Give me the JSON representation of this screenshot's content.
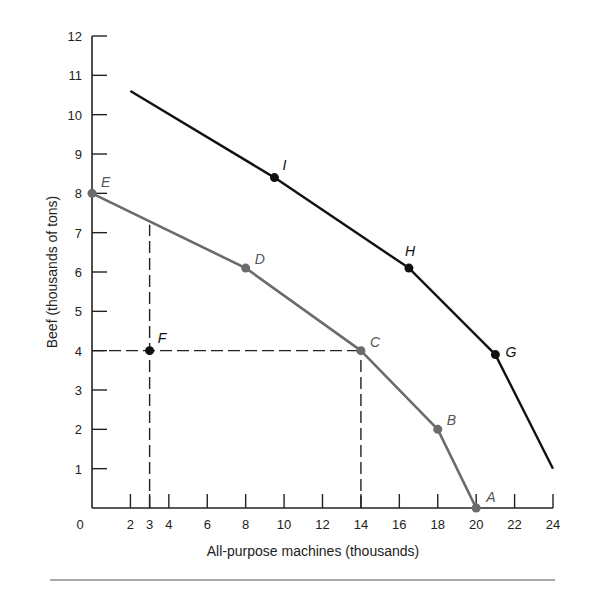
{
  "chart_data": {
    "type": "line",
    "title": "",
    "xlabel": "All-purpose machines (thousands)",
    "ylabel": "Beef (thousands of tons)",
    "xlim": [
      0,
      24
    ],
    "ylim": [
      0,
      12
    ],
    "x_ticks": [
      2,
      3,
      4,
      6,
      8,
      10,
      12,
      14,
      16,
      18,
      20,
      22,
      24
    ],
    "x_tick_labels": [
      "0",
      "2",
      "3",
      "4",
      "6",
      "8",
      "10",
      "12",
      "14",
      "16",
      "18",
      "20",
      "22",
      "24"
    ],
    "y_ticks": [
      1,
      2,
      3,
      4,
      5,
      6,
      7,
      8,
      9,
      10,
      11,
      12
    ],
    "y_tick_labels": [
      "1",
      "2",
      "3",
      "4",
      "5",
      "6",
      "7",
      "8",
      "9",
      "10",
      "11",
      "12"
    ],
    "grid": false,
    "legend": null,
    "series": [
      {
        "name": "Production possibilities curve (original)",
        "color": "#6b6b6b",
        "points": [
          {
            "label": "E",
            "x": 0,
            "y": 8
          },
          {
            "label": "D",
            "x": 8,
            "y": 6.1
          },
          {
            "label": "C",
            "x": 14,
            "y": 4
          },
          {
            "label": "B",
            "x": 18,
            "y": 2
          },
          {
            "label": "A",
            "x": 20,
            "y": 0
          }
        ]
      },
      {
        "name": "Production possibilities curve (shifted outward)",
        "color": "#111111",
        "start": {
          "x": 2,
          "y": 10.6
        },
        "end": {
          "x": 24,
          "y": 1.0
        },
        "points": [
          {
            "label": "I",
            "x": 9.5,
            "y": 8.4
          },
          {
            "label": "H",
            "x": 16.5,
            "y": 6.1
          },
          {
            "label": "G",
            "x": 21,
            "y": 3.9
          }
        ]
      },
      {
        "name": "Point F (inefficient)",
        "color": "#111111",
        "points": [
          {
            "label": "F",
            "x": 3,
            "y": 4
          }
        ]
      }
    ],
    "reference_lines": [
      {
        "type": "vertical-dashed",
        "x": 3,
        "y_from": 0,
        "y_to": 7.2
      },
      {
        "type": "vertical-dashed",
        "x": 14,
        "y_from": 0,
        "y_to": 4
      },
      {
        "type": "horizontal-dashed",
        "y": 4,
        "x_from": 0,
        "x_to": 14
      }
    ]
  }
}
